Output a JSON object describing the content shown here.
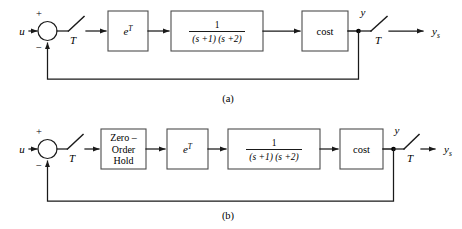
{
  "figure": {
    "background_color": "#ffffff",
    "line_color": "#1a1a1a",
    "block_border_color": "#4d4d4d",
    "panels": [
      {
        "caption": "(a)",
        "input_label": "u",
        "sum_plus": "+",
        "sum_minus": "−",
        "input_sampler_label": "T",
        "output_sampler_label": "T",
        "node_label": "y",
        "output_label": "y",
        "output_label_sub": "s",
        "blocks": [
          {
            "name": "delay",
            "type": "exponential",
            "base": "e",
            "exponent": "T",
            "text": "e^T"
          },
          {
            "name": "plant",
            "type": "fraction",
            "numerator": "1",
            "denominator": "(s +1) (s +2)",
            "text": "1/((s+1)(s+2))"
          },
          {
            "name": "cost",
            "type": "text",
            "text": "cost"
          }
        ]
      },
      {
        "caption": "(b)",
        "input_label": "u",
        "sum_plus": "+",
        "sum_minus": "−",
        "input_sampler_label": "T",
        "output_sampler_label": "T",
        "node_label": "y",
        "output_label": "y",
        "output_label_sub": "s",
        "blocks": [
          {
            "name": "zero-order-hold",
            "type": "multiline",
            "line1": "Zero –",
            "line2": "Order",
            "line3": "Hold",
            "text": "Zero-Order Hold"
          },
          {
            "name": "delay",
            "type": "exponential",
            "base": "e",
            "exponent": "T",
            "text": "e^T"
          },
          {
            "name": "plant",
            "type": "fraction",
            "numerator": "1",
            "denominator": "(s +1) (s +2)",
            "text": "1/((s+1)(s+2))"
          },
          {
            "name": "cost",
            "type": "text",
            "text": "cost"
          }
        ]
      }
    ]
  }
}
